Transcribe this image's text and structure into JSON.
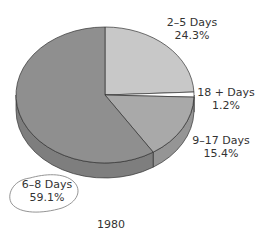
{
  "chart_data": {
    "type": "pie",
    "style": "3d",
    "title": "",
    "caption": "1980",
    "start_angle_deg": 0,
    "direction": "clockwise",
    "slices": [
      {
        "label": "2–5 Days",
        "value": 24.3,
        "value_label": "24.3%",
        "color": "#c8c8c8"
      },
      {
        "label": "18 + Days",
        "value": 1.2,
        "value_label": "1.2%",
        "color": "#ffffff"
      },
      {
        "label": "9–17 Days",
        "value": 15.4,
        "value_label": "15.4%",
        "color": "#a9a9a9"
      },
      {
        "label": "6–8 Days",
        "value": 59.1,
        "value_label": "59.1%",
        "color": "#8f8f8f"
      }
    ],
    "annotation": "hand-drawn circle around 6–8 Days label",
    "legend": "none (direct labels)"
  },
  "geometry": {
    "cx": 105,
    "cy": 95,
    "rx": 89,
    "ry": 68,
    "depth": 15
  }
}
